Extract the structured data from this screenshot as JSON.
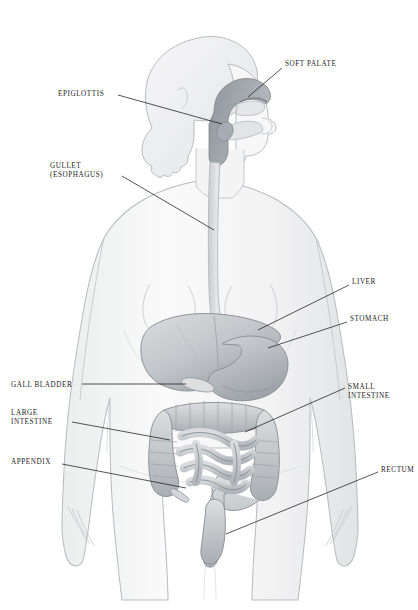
{
  "diagram": {
    "background_color": "#ffffff",
    "line_color": "#1c1c1c",
    "body_outline_color": "#b9bcc0",
    "body_fill_color": "#f4f4f5",
    "organ_fill_color": "#c9ccd0",
    "organ_shade_color": "#9aa0a6",
    "label_text_color": "#1c1c1c"
  },
  "labels": [
    {
      "id": "soft-palate",
      "text": "SOFT PALATE",
      "lines": [
        "SOFT PALATE"
      ],
      "side": "right",
      "x": 285,
      "y": 60,
      "leader": {
        "x1": 282,
        "y1": 68,
        "x2": 248,
        "y2": 97
      }
    },
    {
      "id": "epiglottis",
      "text": "EPIGLOTTIS",
      "lines": [
        "EPIGLOTTIS"
      ],
      "side": "left",
      "x": 58,
      "y": 90,
      "leader": {
        "x1": 118,
        "y1": 95,
        "x2": 222,
        "y2": 124
      }
    },
    {
      "id": "gullet",
      "text": "GULLET (ESOPHAGUS)",
      "lines": [
        "GULLET",
        "(ESOPHAGUS)"
      ],
      "side": "left",
      "x": 50,
      "y": 162,
      "leader": {
        "x1": 122,
        "y1": 176,
        "x2": 214,
        "y2": 230
      }
    },
    {
      "id": "liver",
      "text": "LIVER",
      "lines": [
        "LIVER"
      ],
      "side": "right",
      "x": 352,
      "y": 278,
      "leader": {
        "x1": 349,
        "y1": 285,
        "x2": 258,
        "y2": 330
      }
    },
    {
      "id": "stomach",
      "text": "STOMACH",
      "lines": [
        "STOMACH"
      ],
      "side": "right",
      "x": 350,
      "y": 315,
      "leader": {
        "x1": 347,
        "y1": 322,
        "x2": 268,
        "y2": 348
      }
    },
    {
      "id": "gall-bladder",
      "text": "GALL BLADDER",
      "lines": [
        "GALL BLADDER"
      ],
      "side": "left",
      "x": 11,
      "y": 381,
      "leader": {
        "x1": 82,
        "y1": 384,
        "x2": 186,
        "y2": 384
      }
    },
    {
      "id": "small-intestine",
      "text": "SMALL INTESTINE",
      "lines": [
        "SMALL",
        "INTESTINE"
      ],
      "side": "right",
      "x": 348,
      "y": 383,
      "leader": {
        "x1": 345,
        "y1": 388,
        "x2": 245,
        "y2": 432
      }
    },
    {
      "id": "large-intestine",
      "text": "LARGE INTESTINE",
      "lines": [
        "LARGE",
        "INTESTINE"
      ],
      "side": "left",
      "x": 11,
      "y": 409,
      "leader": {
        "x1": 72,
        "y1": 422,
        "x2": 170,
        "y2": 440
      }
    },
    {
      "id": "appendix",
      "text": "APPENDIX",
      "lines": [
        "APPENDIX"
      ],
      "side": "left",
      "x": 11,
      "y": 458,
      "leader": {
        "x1": 62,
        "y1": 464,
        "x2": 186,
        "y2": 488
      }
    },
    {
      "id": "rectum",
      "text": "RECTUM",
      "lines": [
        "RECTUM"
      ],
      "side": "right",
      "x": 381,
      "y": 466,
      "leader": {
        "x1": 378,
        "y1": 472,
        "x2": 226,
        "y2": 534
      }
    }
  ],
  "organs": [
    {
      "id": "soft-palate",
      "name": "Soft palate"
    },
    {
      "id": "epiglottis",
      "name": "Epiglottis"
    },
    {
      "id": "esophagus",
      "name": "Gullet (esophagus)"
    },
    {
      "id": "liver",
      "name": "Liver"
    },
    {
      "id": "stomach",
      "name": "Stomach"
    },
    {
      "id": "gall-bladder",
      "name": "Gall bladder"
    },
    {
      "id": "small-intestine",
      "name": "Small intestine"
    },
    {
      "id": "large-intestine",
      "name": "Large intestine"
    },
    {
      "id": "appendix",
      "name": "Appendix"
    },
    {
      "id": "rectum",
      "name": "Rectum"
    }
  ]
}
